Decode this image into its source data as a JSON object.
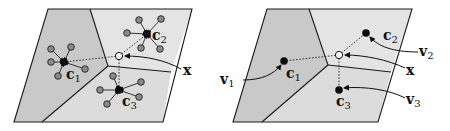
{
  "figure": {
    "colors": {
      "region_dark": "#c9c9c9",
      "region_light": "#e4e4e4",
      "outline": "#1a1a1a",
      "centroid": "#0a0a0a",
      "member_point": "#8a8a8a",
      "query_point_fill": "#ffffff"
    },
    "left_panel": {
      "labels": {
        "c1": {
          "main": "c",
          "sub": "1"
        },
        "c2": {
          "main": "c",
          "sub": "2"
        },
        "c3": {
          "main": "c",
          "sub": "3"
        },
        "x": "x"
      }
    },
    "right_panel": {
      "labels": {
        "c1": {
          "main": "c",
          "sub": "1"
        },
        "c2": {
          "main": "c",
          "sub": "2"
        },
        "c3": {
          "main": "c",
          "sub": "3"
        },
        "x": "x",
        "v1": {
          "main": "v",
          "sub": "1"
        },
        "v2": {
          "main": "v",
          "sub": "2"
        },
        "v3": {
          "main": "v",
          "sub": "3"
        }
      }
    }
  }
}
